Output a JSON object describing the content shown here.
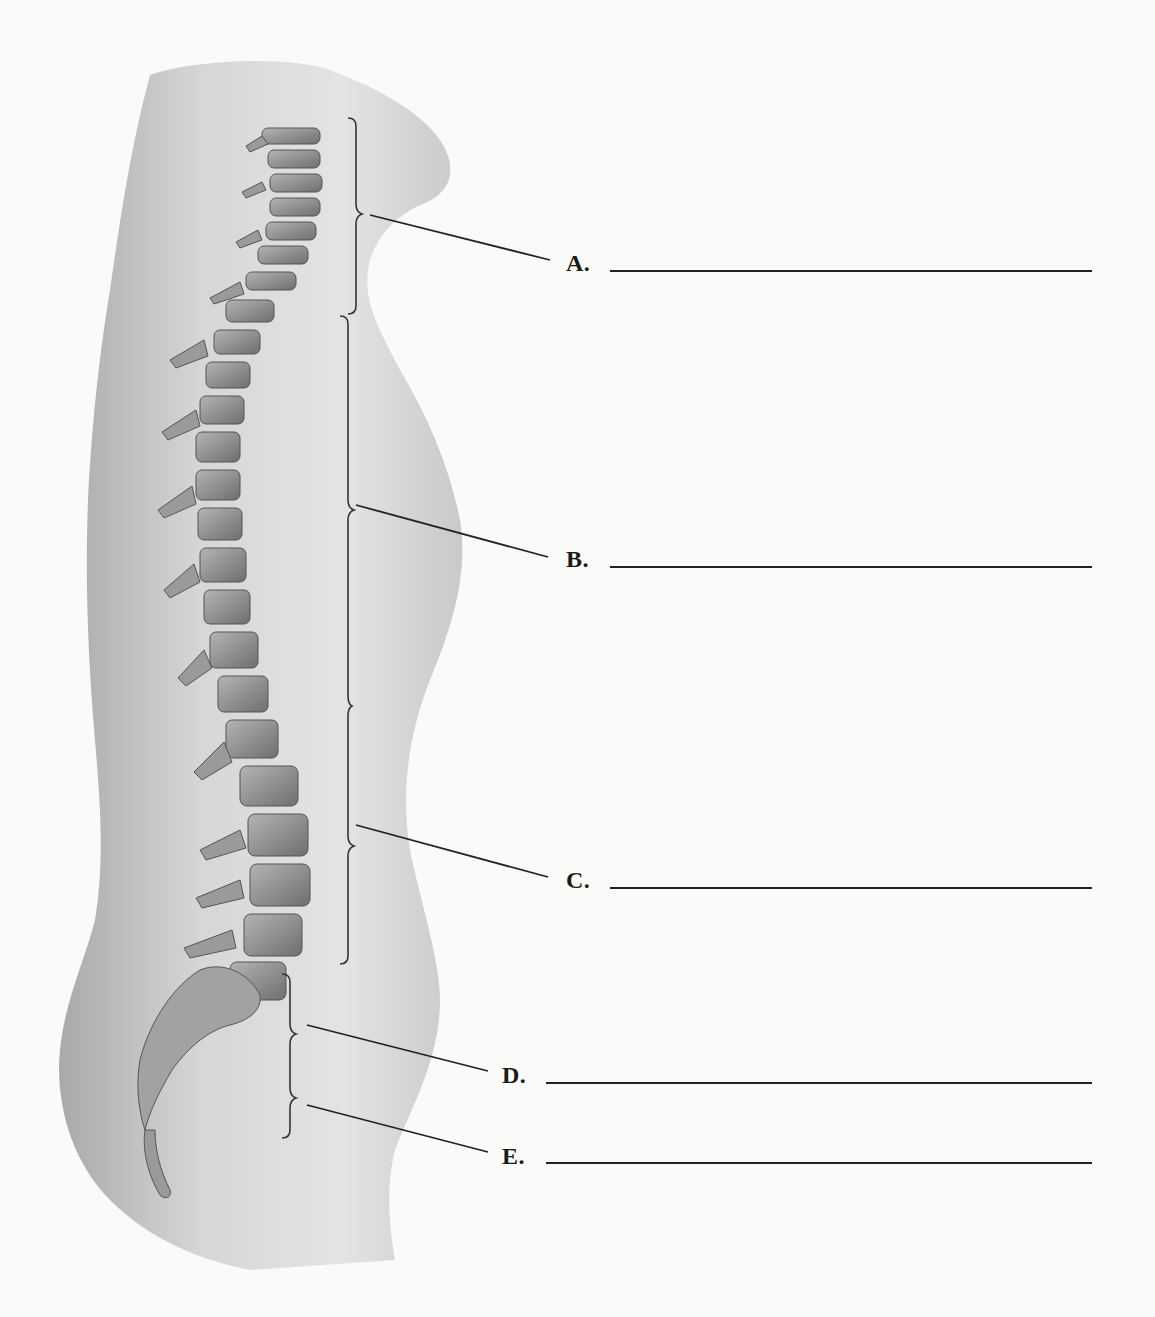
{
  "figure": {
    "regions": [
      {
        "letter": "A.",
        "answer": ""
      },
      {
        "letter": "B.",
        "answer": ""
      },
      {
        "letter": "C.",
        "answer": ""
      },
      {
        "letter": "D.",
        "answer": ""
      },
      {
        "letter": "E.",
        "answer": ""
      }
    ]
  },
  "colors": {
    "background": "#fafaf8",
    "body_light": "#e6e6e4",
    "body_dark": "#9c9c9a",
    "bone": "#8e8e8c",
    "bone_dark": "#4a4a48",
    "ink": "#1a1a1a"
  }
}
